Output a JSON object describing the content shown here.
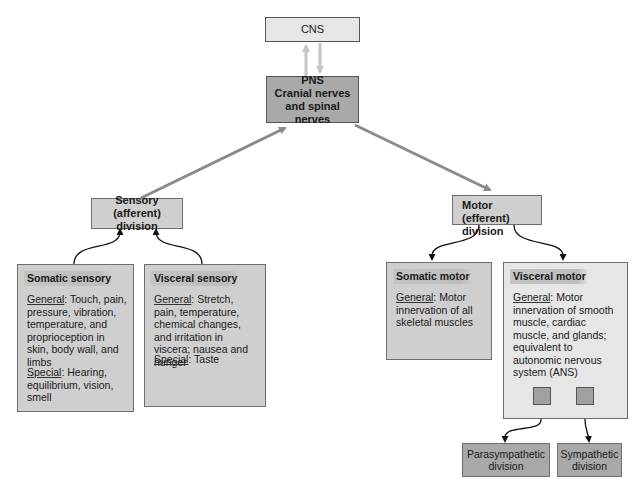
{
  "diagram": {
    "cns": {
      "label": "CNS"
    },
    "pns": {
      "lines": [
        "PNS",
        "Cranial nerves",
        "and spinal nerves"
      ]
    },
    "sensory_division": {
      "lines": [
        "Sensory (afferent)",
        "division"
      ]
    },
    "motor_division": {
      "lines": [
        "Motor (efferent)",
        "division"
      ]
    },
    "somatic_sensory": {
      "title": "Somatic sensory",
      "general_label": "General",
      "general_text": ": Touch, pain, pressure, vibration, temperature, and proprioception in skin, body wall, and limbs",
      "special_label": "Special",
      "special_text": ": Hearing, equilibrium, vision, smell"
    },
    "visceral_sensory": {
      "title": "Visceral sensory",
      "general_label": "General",
      "general_text": ": Stretch, pain, temperature, chemical changes, and irritation in viscera; nausea and hunger",
      "special_label": "Special",
      "special_text": ": Taste"
    },
    "somatic_motor": {
      "title": "Somatic motor",
      "general_label": "General",
      "general_text": ": Motor innervation of all skeletal muscles"
    },
    "visceral_motor": {
      "title": "Visceral motor",
      "general_label": "General",
      "general_text": ": Motor innervation of smooth muscle, cardiac muscle, and glands; equivalent to autonomic nervous system (ANS)"
    },
    "parasympathetic": {
      "lines": [
        "Parasympathetic",
        "division"
      ]
    },
    "sympathetic": {
      "lines": [
        "Sympathetic",
        "division"
      ]
    },
    "colors": {
      "arrow_gray": "#8a8a8a",
      "arrow_light": "#c8c8c8",
      "connector": "#111111",
      "box_light": "#e6e6e6",
      "box_mid": "#cfcfcf",
      "box_dark": "#a8a8a8"
    }
  }
}
